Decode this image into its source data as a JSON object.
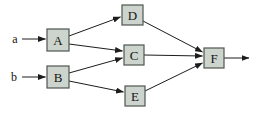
{
  "diagram": {
    "type": "block-diagram",
    "background": "#ffffff",
    "node_fill": "#cdd3cd",
    "node_border": "#4f554f",
    "edge_color": "#1c1c1c",
    "label_color": "#141414",
    "canvas": {
      "width": 258,
      "height": 116
    },
    "nodes": [
      {
        "id": "A",
        "label": "A",
        "x": 47,
        "y": 29,
        "w": 22,
        "h": 22
      },
      {
        "id": "B",
        "label": "B",
        "x": 47,
        "y": 66,
        "w": 22,
        "h": 22
      },
      {
        "id": "D",
        "label": "D",
        "x": 122,
        "y": 5,
        "w": 21,
        "h": 20
      },
      {
        "id": "C",
        "label": "C",
        "x": 124,
        "y": 45,
        "w": 20,
        "h": 20
      },
      {
        "id": "E",
        "label": "E",
        "x": 125,
        "y": 86,
        "w": 20,
        "h": 20
      },
      {
        "id": "F",
        "label": "F",
        "x": 204,
        "y": 48,
        "w": 20,
        "h": 20
      }
    ],
    "inputs": [
      {
        "id": "a",
        "label": "a",
        "x": 15,
        "y": 39
      },
      {
        "id": "b",
        "label": "b",
        "x": 14,
        "y": 77
      }
    ],
    "edges": [
      {
        "name": "a-to-A",
        "x1": 22,
        "y1": 39,
        "x2": 45.5,
        "y2": 39
      },
      {
        "name": "b-to-B",
        "x1": 22,
        "y1": 77,
        "x2": 45.5,
        "y2": 77
      },
      {
        "name": "A-to-D",
        "x1": 69,
        "y1": 36,
        "x2": 120.5,
        "y2": 17
      },
      {
        "name": "A-to-C",
        "x1": 69,
        "y1": 44,
        "x2": 122.5,
        "y2": 51
      },
      {
        "name": "B-to-C",
        "x1": 69,
        "y1": 73,
        "x2": 122.5,
        "y2": 58
      },
      {
        "name": "B-to-E",
        "x1": 69,
        "y1": 81,
        "x2": 123.5,
        "y2": 92
      },
      {
        "name": "D-to-F",
        "x1": 143,
        "y1": 21,
        "x2": 202.5,
        "y2": 52
      },
      {
        "name": "C-to-F",
        "x1": 144,
        "y1": 55,
        "x2": 202.5,
        "y2": 56
      },
      {
        "name": "E-to-F",
        "x1": 145,
        "y1": 91,
        "x2": 202.5,
        "y2": 63
      },
      {
        "name": "F-to-output",
        "x1": 224,
        "y1": 58,
        "x2": 249,
        "y2": 58
      }
    ]
  }
}
